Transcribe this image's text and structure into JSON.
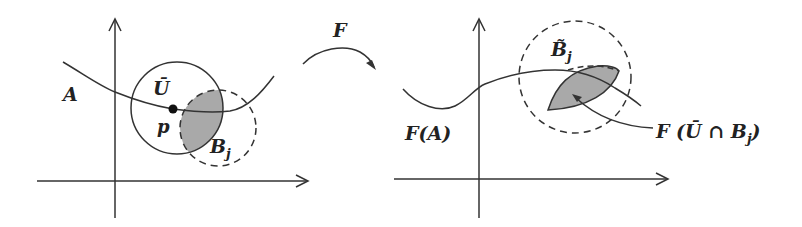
{
  "diagram": {
    "left_panel": {
      "set_label": "A",
      "neighborhood_label": "Ū",
      "point_label": "p",
      "ball_label_main": "B",
      "ball_label_sub": "j"
    },
    "mapping": {
      "label": "F"
    },
    "right_panel": {
      "image_label": "F(A)",
      "ball_label_main": "B̃",
      "ball_label_sub": "j",
      "intersection_label_pre": "F (Ū ∩ B",
      "intersection_label_sub": "j",
      "intersection_label_post": ")"
    },
    "colors": {
      "stroke": "#333333",
      "shade": "#a9a9a9",
      "background": "#ffffff"
    }
  }
}
